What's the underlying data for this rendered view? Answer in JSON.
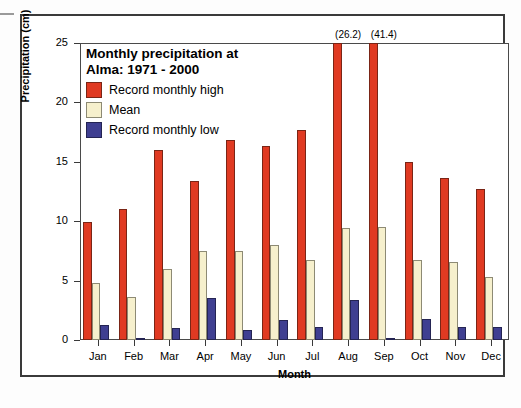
{
  "chart_data": {
    "type": "bar",
    "title": "Monthly precipitation at\nAlma: 1971 - 2000",
    "title_line1": "Monthly precipitation at",
    "title_line2": "Alma: 1971 - 2000",
    "xlabel": "Month",
    "ylabel": "Precipitation (cm)",
    "ylim": [
      0,
      25
    ],
    "yticks": [
      0,
      5,
      10,
      15,
      20,
      25
    ],
    "grid": false,
    "legend_position": "upper-left-inside",
    "categories": [
      "Jan",
      "Feb",
      "Mar",
      "Apr",
      "May",
      "Jun",
      "Jul",
      "Aug",
      "Sep",
      "Oct",
      "Nov",
      "Dec"
    ],
    "series": [
      {
        "name": "Record monthly high",
        "color": "#e03a22",
        "values": [
          9.9,
          11.0,
          16.0,
          13.4,
          16.8,
          16.3,
          17.7,
          26.2,
          41.4,
          15.0,
          13.6,
          12.7
        ]
      },
      {
        "name": "Mean",
        "color": "#f6f0cd",
        "values": [
          4.8,
          3.6,
          6.0,
          7.5,
          7.5,
          8.0,
          6.7,
          9.4,
          9.5,
          6.7,
          6.6,
          5.3
        ]
      },
      {
        "name": "Record monthly low",
        "color": "#3f3f91",
        "values": [
          1.3,
          0.2,
          1.0,
          3.5,
          0.8,
          1.7,
          1.1,
          3.4,
          0.2,
          1.8,
          1.1,
          1.1
        ]
      }
    ],
    "annotations": [
      {
        "text": "(26.2)",
        "category": "Aug",
        "series": "Record monthly high",
        "note": "value exceeds axis maximum"
      },
      {
        "text": "(41.4)",
        "category": "Sep",
        "series": "Record monthly high",
        "note": "value exceeds axis maximum"
      }
    ]
  }
}
